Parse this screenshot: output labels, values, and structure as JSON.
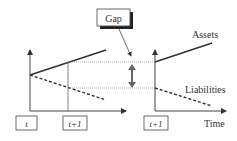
{
  "diagram": {
    "type": "asset-liability gap diagram",
    "callout": {
      "label": "Gap"
    },
    "series": {
      "assets": {
        "label": "Assets",
        "style": "solid"
      },
      "liabilities": {
        "label": "Liabilities",
        "style": "dashed"
      }
    },
    "x_axis": {
      "label": "Time"
    },
    "time_markers": [
      {
        "label": "t"
      },
      {
        "label": "t+1"
      },
      {
        "label": "t+1"
      }
    ],
    "colors": {
      "line": "#333333",
      "guide": "#888888",
      "arrow": "#666666",
      "box_shadow": "#222222"
    }
  }
}
